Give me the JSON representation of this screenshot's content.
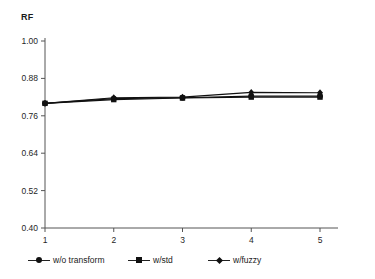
{
  "chart_data": {
    "type": "line",
    "title": "",
    "ylabel": "RF",
    "xlabel": "",
    "x": [
      1,
      2,
      3,
      4,
      5
    ],
    "categories": [
      "1",
      "2",
      "3",
      "4",
      "5"
    ],
    "xtick_labels": [
      "1",
      "2",
      "3",
      "4",
      "5"
    ],
    "ytick_labels": [
      "1.00",
      "0.88",
      "0.76",
      "0.64",
      "0.52",
      "0.40"
    ],
    "ytick_values": [
      1.0,
      0.88,
      0.76,
      0.64,
      0.52,
      0.4
    ],
    "ylim": [
      0.4,
      1.0
    ],
    "xlim": [
      1,
      5
    ],
    "grid": false,
    "legend_position": "bottom",
    "series": [
      {
        "name": "w/o transform",
        "marker": "circle",
        "color": "#111111",
        "values": [
          0.8,
          0.815,
          0.818,
          0.823,
          0.823
        ]
      },
      {
        "name": "w/std",
        "marker": "square",
        "color": "#111111",
        "values": [
          0.8,
          0.812,
          0.817,
          0.82,
          0.82
        ]
      },
      {
        "name": "w/fuzzy",
        "marker": "diamond",
        "color": "#111111",
        "values": [
          0.8,
          0.818,
          0.82,
          0.835,
          0.834
        ]
      }
    ]
  },
  "axes": {
    "y_title": "RF",
    "axis_color": "#555555"
  },
  "legend": {
    "items": [
      {
        "label": "w/o transform",
        "marker": "circle"
      },
      {
        "label": "w/std",
        "marker": "square"
      },
      {
        "label": "w/fuzzy",
        "marker": "diamond"
      }
    ]
  }
}
